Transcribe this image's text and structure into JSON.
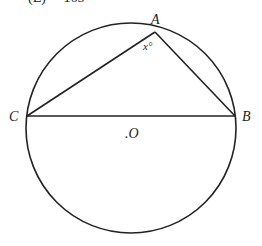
{
  "header": {
    "cutoff_choice": "(E)     165"
  },
  "diagram": {
    "circle": {
      "cx": 131,
      "cy": 128,
      "r": 105
    },
    "points": {
      "A": {
        "x": 155,
        "y": 32,
        "label": "A"
      },
      "B": {
        "x": 235,
        "y": 116,
        "label": "B"
      },
      "C": {
        "x": 27,
        "y": 116,
        "label": "C"
      },
      "O": {
        "label": ".O"
      }
    },
    "angle_label": "x°",
    "stroke_color": "#222222"
  }
}
